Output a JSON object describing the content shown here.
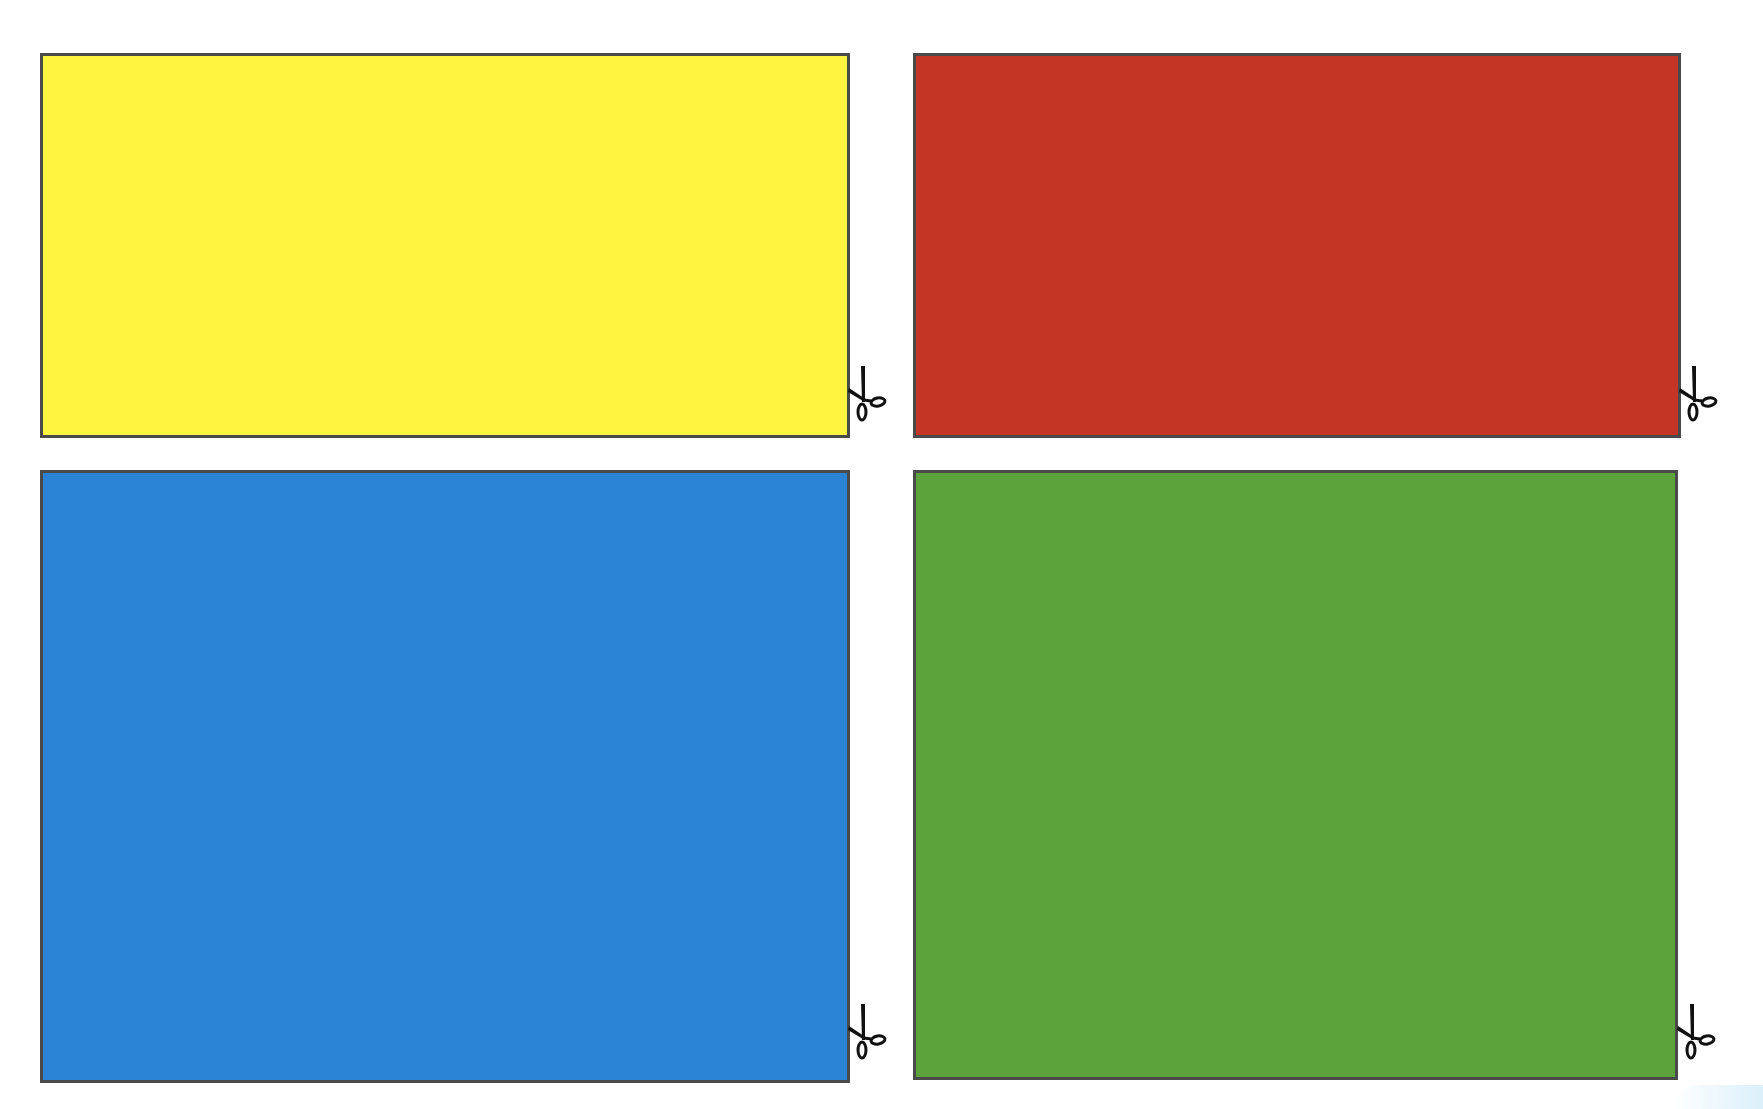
{
  "page": {
    "background": "#ffffff",
    "border_color": "#4a4a4a"
  },
  "cards": [
    {
      "name": "yellow",
      "color": "#fff43f",
      "icon": "scissors-icon"
    },
    {
      "name": "red",
      "color": "#c53526",
      "icon": "scissors-icon"
    },
    {
      "name": "blue",
      "color": "#2a83d4",
      "icon": "scissors-icon"
    },
    {
      "name": "green",
      "color": "#5ca33c",
      "icon": "scissors-icon"
    }
  ]
}
